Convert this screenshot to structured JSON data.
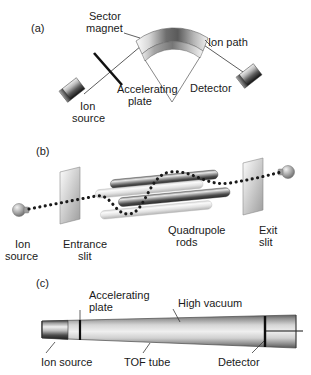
{
  "figure": {
    "panels": [
      {
        "id": "a",
        "label": "(a)",
        "instrument": "magnetic sector mass analyzer",
        "labels": {
          "sector_magnet": "Sector\nmagnet",
          "sector_magnet_line1": "Sector",
          "sector_magnet_line2": "magnet",
          "ion_path": "Ion path",
          "accelerating_plate_line1": "Accelerating",
          "accelerating_plate_line2": "plate",
          "ion_source_line1": "Ion",
          "ion_source_line2": "source",
          "detector": "Detector"
        }
      },
      {
        "id": "b",
        "label": "(b)",
        "instrument": "quadrupole mass analyzer",
        "labels": {
          "ion_source_line1": "Ion",
          "ion_source_line2": "source",
          "entrance_slit_line1": "Entrance",
          "entrance_slit_line2": "slit",
          "quadrupole_rods_line1": "Quadrupole",
          "quadrupole_rods_line2": "rods",
          "exit_slit_line1": "Exit",
          "exit_slit_line2": "slit"
        }
      },
      {
        "id": "c",
        "label": "(c)",
        "instrument": "time-of-flight mass analyzer",
        "labels": {
          "accelerating_plate_line1": "Accelerating",
          "accelerating_plate_line2": "plate",
          "high_vacuum": "High vacuum",
          "ion_source": "Ion source",
          "tof_tube": "TOF tube",
          "detector": "Detector"
        }
      }
    ],
    "colors": {
      "background": "#ffffff",
      "ink": "#1a1a1a",
      "line": "#4a4a4a",
      "metal_dark": "#3d3d3d",
      "metal_mid": "#8f8f8f",
      "metal_light": "#e8e8e8"
    }
  }
}
